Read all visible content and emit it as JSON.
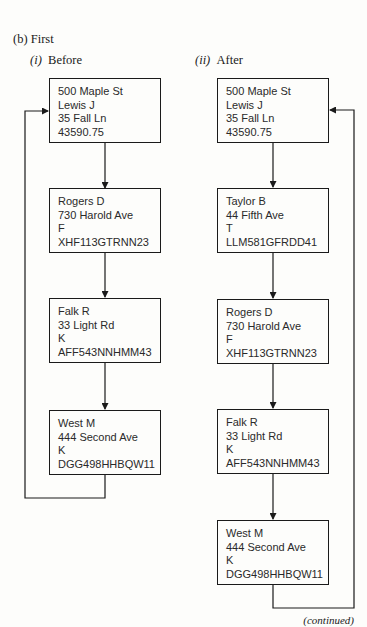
{
  "figure": {
    "title": "(b) First",
    "continued": "(continued)"
  },
  "panels": [
    {
      "label_num": "(i)",
      "label": "Before",
      "nodes": [
        {
          "lines": [
            "500 Maple St",
            "Lewis J",
            "35 Fall Ln",
            "43590.75"
          ]
        },
        {
          "lines": [
            "Rogers D",
            "730 Harold Ave",
            "F",
            "XHF113GTRNN23"
          ]
        },
        {
          "lines": [
            "Falk R",
            "33 Light Rd",
            "K",
            "AFF543NNHMM43"
          ]
        },
        {
          "lines": [
            "West M",
            "444 Second Ave",
            "K",
            "DGG498HHBQW11"
          ]
        }
      ]
    },
    {
      "label_num": "(ii)",
      "label": "After",
      "nodes": [
        {
          "lines": [
            "500 Maple St",
            "Lewis J",
            "35 Fall Ln",
            "43590.75"
          ]
        },
        {
          "lines": [
            "Taylor B",
            "44 Fifth Ave",
            "T",
            "LLM581GFRDD41"
          ]
        },
        {
          "lines": [
            "Rogers D",
            "730 Harold Ave",
            "F",
            "XHF113GTRNN23"
          ]
        },
        {
          "lines": [
            "Falk R",
            "33 Light Rd",
            "K",
            "AFF543NNHMM43"
          ]
        },
        {
          "lines": [
            "West M",
            "444 Second Ave",
            "K",
            "DGG498HHBQW11"
          ]
        }
      ]
    }
  ]
}
